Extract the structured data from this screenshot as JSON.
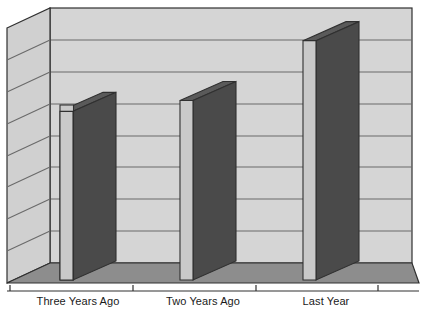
{
  "chart_data": {
    "type": "bar",
    "title": "",
    "subtitle": "",
    "xlabel": "",
    "ylabel": "",
    "categories": [
      "Three Years Ago",
      "Two Years Ago",
      "Last Year"
    ],
    "values": [
      62,
      66,
      88
    ],
    "ylim": [
      0,
      100
    ],
    "grid": true,
    "gridlines": [
      0,
      12.5,
      25,
      37.5,
      50,
      62.5,
      75,
      87.5,
      100
    ],
    "tick_labels": [],
    "legend": [],
    "legend_position": "none",
    "annotations": [],
    "style": "3d-perspective-column",
    "series": [
      {
        "name": "",
        "values": [
          62,
          66,
          88
        ]
      }
    ]
  },
  "colors": {
    "background": "#ffffff",
    "back_wall": "#d5d5d5",
    "side_wall": "#d0d0d0",
    "floor": "#8d8d8d",
    "bar_front": "#c9c9c9",
    "bar_side": "#4a4a4a",
    "bar_top": "#5a5a5a",
    "gridline": "#6a6a6a",
    "outline": "#303030",
    "axis": "#303030",
    "label_text": "#1a1a1a"
  },
  "axis": {
    "baseline_y": 291,
    "tick_positions": [
      10,
      133,
      256,
      378
    ]
  },
  "bars": [
    {
      "label": "Three Years Ago",
      "value": 62,
      "front_left": 60,
      "front_right": 108,
      "front_top": 105
    },
    {
      "label": "Two Years Ago",
      "value": 66,
      "front_left": 180,
      "front_right": 229,
      "front_top": 95
    },
    {
      "label": "Last Year",
      "value": 88,
      "front_left": 303,
      "front_right": 352,
      "front_top": 38
    }
  ]
}
